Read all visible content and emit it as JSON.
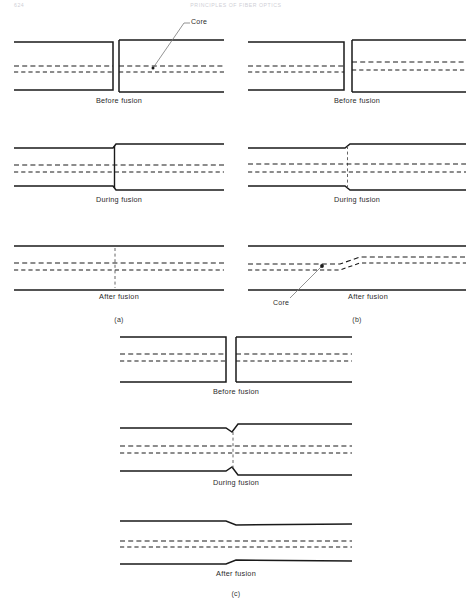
{
  "page": {
    "running_head_left": "624",
    "running_head_center": "PRINCIPLES OF FIBER OPTICS",
    "width": 472,
    "height": 604,
    "background": "#ffffff",
    "ink": "#1a1a1a"
  },
  "figure": {
    "title_label_core": "Core",
    "stages": {
      "before": "Before fusion",
      "during": "During fusion",
      "after": "After fusion"
    },
    "section_labels": {
      "a": "(a)",
      "b": "(b)",
      "c": "(c)"
    }
  },
  "panels": [
    {
      "id": "a",
      "label": "(a)",
      "description": "Fusion splice of two fibers of unequal cladding diameter with aligned cores",
      "rows": [
        {
          "stage_key": "before",
          "stage": "Before fusion",
          "callout": "Core",
          "callout_present": true,
          "geometry": {
            "left_fiber": {
              "x0": 14,
              "x1": 113,
              "top": 42,
              "bottom": 90,
              "core_lines": [
                66,
                72
              ]
            },
            "right_fiber": {
              "x0": 119,
              "x1": 224,
              "top": 40,
              "bottom": 92,
              "core_lines": [
                66,
                72
              ]
            },
            "gap": 6
          }
        },
        {
          "stage_key": "during",
          "stage": "During fusion",
          "callout": "",
          "callout_present": false,
          "geometry": {
            "left_top": 148,
            "left_bottom": 186,
            "right_top": 144,
            "right_bottom": 190,
            "joint_x": 115,
            "joint_style": "solid",
            "core_lines": [
              165,
              172
            ],
            "x0": 14,
            "x1": 224
          }
        },
        {
          "stage_key": "after",
          "stage": "After fusion",
          "callout": "",
          "callout_present": false,
          "geometry": {
            "top": 246,
            "bottom": 290,
            "joint_x": 115,
            "joint_style": "dashed",
            "core_lines": [
              263,
              270
            ],
            "x0": 14,
            "x1": 224
          }
        }
      ]
    },
    {
      "id": "b",
      "label": "(b)",
      "description": "Fusion splice of two fibers with laterally offset cores producing a kinked core after fusion",
      "rows": [
        {
          "stage_key": "before",
          "stage": "Before fusion",
          "callout": "",
          "callout_present": false,
          "geometry": {
            "left_fiber": {
              "x0": 248,
              "x1": 344,
              "top": 42,
              "bottom": 90,
              "core_lines": [
                66,
                72
              ]
            },
            "right_fiber": {
              "x0": 352,
              "x1": 466,
              "top": 40,
              "bottom": 92,
              "core_lines": [
                62,
                70
              ]
            },
            "gap": 8
          }
        },
        {
          "stage_key": "during",
          "stage": "During fusion",
          "callout": "",
          "callout_present": false,
          "geometry": {
            "left_top": 148,
            "left_bottom": 186,
            "right_top": 144,
            "right_bottom": 190,
            "joint_x": 348,
            "joint_style": "dashed",
            "core_lines": [
              164,
              172
            ],
            "x0": 248,
            "x1": 466
          }
        },
        {
          "stage_key": "after",
          "stage": "After fusion",
          "callout": "Core",
          "callout_present": true,
          "geometry": {
            "top": 246,
            "bottom": 290,
            "core_left_y": [
              264,
              270
            ],
            "core_right_y": [
              257,
              263
            ],
            "step_x0": 340,
            "step_x1": 360,
            "x0": 248,
            "x1": 466
          }
        }
      ]
    },
    {
      "id": "c",
      "label": "(c)",
      "description": "Fusion splice of matched fibers with slight neck-down at the joint",
      "rows": [
        {
          "stage_key": "before",
          "stage": "Before fusion",
          "callout": "",
          "callout_present": false,
          "geometry": {
            "left_fiber": {
              "x0": 120,
              "x1": 226,
              "top": 337,
              "bottom": 382,
              "core_lines": [
                354,
                361
              ]
            },
            "right_fiber": {
              "x0": 236,
              "x1": 352,
              "top": 337,
              "bottom": 382,
              "core_lines": [
                354,
                361
              ]
            },
            "gap": 10
          }
        },
        {
          "stage_key": "during",
          "stage": "During fusion",
          "callout": "",
          "callout_present": false,
          "geometry": {
            "left_top": 428,
            "left_bottom": 471,
            "right_top": 424,
            "right_bottom": 475,
            "neck_x0": 228,
            "neck_x1": 240,
            "core_lines": [
              446,
              453
            ],
            "x0": 120,
            "x1": 352
          }
        },
        {
          "stage_key": "after",
          "stage": "After fusion",
          "callout": "",
          "callout_present": false,
          "geometry": {
            "left_top": 521,
            "left_bottom": 564,
            "right_top": 524,
            "right_bottom": 561,
            "neck_x0": 228,
            "neck_x1": 242,
            "core_lines": [
              541,
              547
            ],
            "x0": 120,
            "x1": 352
          }
        }
      ]
    }
  ],
  "captions": [
    {
      "id": "cap-a-before",
      "text": "Before fusion",
      "x": 119,
      "y": 100
    },
    {
      "id": "cap-b-before",
      "text": "Before fusion",
      "x": 357,
      "y": 100
    },
    {
      "id": "cap-a-during",
      "text": "During fusion",
      "x": 119,
      "y": 199
    },
    {
      "id": "cap-b-during",
      "text": "During fusion",
      "x": 357,
      "y": 199
    },
    {
      "id": "cap-a-after",
      "text": "After fusion",
      "x": 119,
      "y": 296
    },
    {
      "id": "cap-b-after",
      "text": "After fusion",
      "x": 368,
      "y": 296
    },
    {
      "id": "cap-a-section",
      "text": "(a)",
      "x": 119,
      "y": 320
    },
    {
      "id": "cap-b-section",
      "text": "(b)",
      "x": 357,
      "y": 320
    },
    {
      "id": "cap-c-before",
      "text": "Before fusion",
      "x": 236,
      "y": 391
    },
    {
      "id": "cap-c-during",
      "text": "During fusion",
      "x": 236,
      "y": 482
    },
    {
      "id": "cap-c-after",
      "text": "After fusion",
      "x": 236,
      "y": 573
    },
    {
      "id": "cap-c-section",
      "text": "(c)",
      "x": 236,
      "y": 594
    }
  ],
  "callouts": [
    {
      "id": "callout-core-top",
      "text": "Core",
      "label_x": 193,
      "label_y": 22,
      "tip_x": 153,
      "tip_y": 68
    },
    {
      "id": "callout-core-bottom",
      "text": "Core",
      "label_x": 283,
      "label_y": 303,
      "tip_x": 322,
      "tip_y": 266
    }
  ]
}
